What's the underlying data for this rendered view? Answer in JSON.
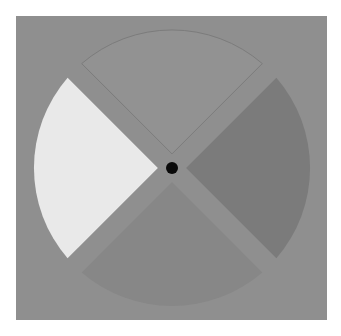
{
  "stimulus": {
    "background_color": "#8f8f8f",
    "fixation": {
      "color": "#0a0a0a",
      "radius": 6
    },
    "center": [
      172,
      168
    ],
    "outer_radius": 138,
    "wedges": [
      {
        "position": "top",
        "angle_deg": 270,
        "fill": "#929292",
        "stroke": "#7c7c7c"
      },
      {
        "position": "left",
        "angle_deg": 180,
        "fill": "#e9e9e9",
        "stroke": "none"
      },
      {
        "position": "right",
        "angle_deg": 0,
        "fill": "#7b7b7b",
        "stroke": "none"
      },
      {
        "position": "bottom",
        "angle_deg": 90,
        "fill": "#878787",
        "stroke": "none"
      }
    ]
  }
}
